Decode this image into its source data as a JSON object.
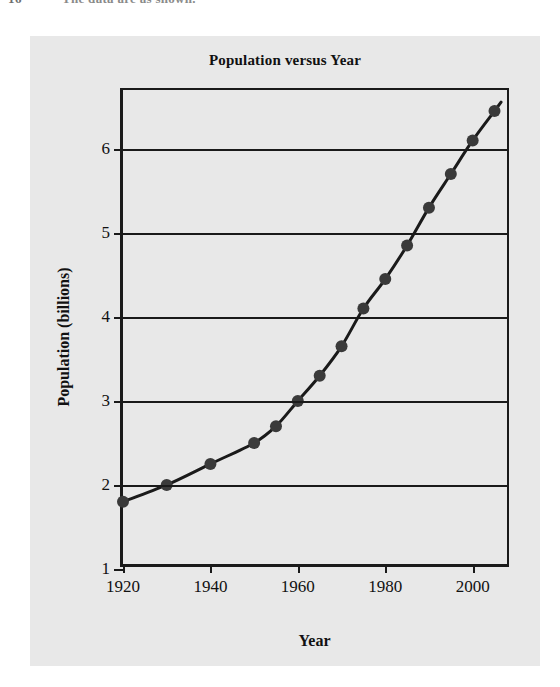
{
  "page_header": {
    "number": "16",
    "title": "The data are as shown."
  },
  "figure": {
    "background_color": "#e8e8e8",
    "title": "Population versus Year",
    "x_axis_label": "Year",
    "y_axis_label": "Population (billions)"
  },
  "chart_data": {
    "type": "scatter",
    "title": "Population versus Year",
    "xlabel": "Year",
    "ylabel": "Population (billions)",
    "xlim": [
      1920,
      2009
    ],
    "ylim": [
      1,
      6.7
    ],
    "xticks": [
      1920,
      1940,
      1960,
      1980,
      2000
    ],
    "xtick_labels": [
      "1920",
      "1940",
      "1960",
      "1980",
      "2000"
    ],
    "yticks": [
      1,
      2,
      3,
      4,
      5,
      6
    ],
    "ytick_labels": [
      "1",
      "2",
      "3",
      "4",
      "5",
      "6"
    ],
    "grid": "horizontal",
    "legend": "none",
    "marker_color": "#3a3a3a",
    "line_color": "#1a1a1a",
    "series": [
      {
        "name": "World population",
        "marker": "filled-circle",
        "fit_curve": true,
        "x": [
          1920,
          1930,
          1940,
          1950,
          1955,
          1960,
          1965,
          1970,
          1975,
          1980,
          1985,
          1990,
          1995,
          2000,
          2005
        ],
        "y": [
          1.8,
          2.0,
          2.25,
          2.5,
          2.7,
          3.0,
          3.3,
          3.65,
          4.1,
          4.45,
          4.85,
          5.3,
          5.7,
          6.1,
          6.45
        ]
      }
    ]
  }
}
